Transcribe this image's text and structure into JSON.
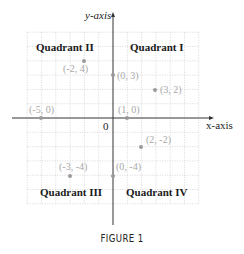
{
  "figure": {
    "caption": "FIGURE 1",
    "axes": {
      "x_label": "x-axis",
      "y_label": "y-axis",
      "origin_label": "0"
    },
    "quadrants": [
      {
        "label": "Quadrant I"
      },
      {
        "label": "Quadrant II"
      },
      {
        "label": "Quadrant III"
      },
      {
        "label": "Quadrant IV"
      }
    ],
    "points": [
      {
        "label": "(-2, 4)",
        "x": -2,
        "y": 4
      },
      {
        "label": "(0, 3)",
        "x": 0,
        "y": 3
      },
      {
        "label": "(3, 2)",
        "x": 3,
        "y": 2
      },
      {
        "label": "(-5, 0)",
        "x": -5,
        "y": 0
      },
      {
        "label": "(1, 0)",
        "x": 1,
        "y": 0
      },
      {
        "label": "(2, -2)",
        "x": 2,
        "y": -2
      },
      {
        "label": "(-3, -4)",
        "x": -3,
        "y": -4
      },
      {
        "label": "(0, -4)",
        "x": 0,
        "y": -4
      }
    ],
    "grid": {
      "min": -6,
      "max": 6
    },
    "colors": {
      "axis": "#333333",
      "grid": "#bdbdbd",
      "point": "#9a9a9a",
      "point_label": "#a8a8a8",
      "quadrant_label": "#1a1a1a"
    }
  },
  "chart_data": {
    "type": "scatter",
    "title": "FIGURE 1",
    "xlabel": "x-axis",
    "ylabel": "y-axis",
    "xlim": [
      -6,
      6
    ],
    "ylim": [
      -6,
      6
    ],
    "grid": true,
    "annotations": [
      "Quadrant I",
      "Quadrant II",
      "Quadrant III",
      "Quadrant IV",
      "0"
    ],
    "series": [
      {
        "name": "points",
        "x": [
          -2,
          0,
          3,
          -5,
          1,
          2,
          -3,
          0
        ],
        "y": [
          4,
          3,
          2,
          0,
          0,
          -2,
          -4,
          -4
        ],
        "labels": [
          "(-2, 4)",
          "(0, 3)",
          "(3, 2)",
          "(-5, 0)",
          "(1, 0)",
          "(2, -2)",
          "(-3, -4)",
          "(0, -4)"
        ]
      }
    ]
  }
}
